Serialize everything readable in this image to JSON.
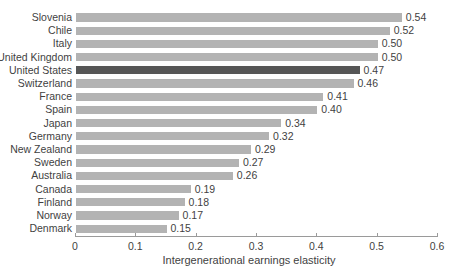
{
  "chart_data": {
    "type": "bar",
    "orientation": "horizontal",
    "title": "",
    "xlabel": "Intergenerational earnings elasticity",
    "ylabel": "",
    "xlim": [
      0,
      0.6
    ],
    "xticks": [
      "0",
      "0.1",
      "0.2",
      "0.3",
      "0.4",
      "0.5",
      "0.6"
    ],
    "xtick_values": [
      0,
      0.1,
      0.2,
      0.3,
      0.4,
      0.5,
      0.6
    ],
    "grid": false,
    "legend": false,
    "highlight_category": "United States",
    "colors": {
      "bar": "#b3b3b3",
      "bar_highlight": "#565656",
      "axis": "#9a9a9a",
      "text": "#3f3f3f",
      "background": "#ffffff"
    },
    "categories": [
      "Slovenia",
      "Chile",
      "Italy",
      "United Kingdom",
      "United States",
      "Switzerland",
      "France",
      "Spain",
      "Japan",
      "Germany",
      "New Zealand",
      "Sweden",
      "Australia",
      "Canada",
      "Finland",
      "Norway",
      "Denmark"
    ],
    "values": [
      0.54,
      0.52,
      0.5,
      0.5,
      0.47,
      0.46,
      0.41,
      0.4,
      0.34,
      0.32,
      0.29,
      0.27,
      0.26,
      0.19,
      0.18,
      0.17,
      0.15
    ],
    "value_labels": [
      "0.54",
      "0.52",
      "0.50",
      "0.50",
      "0.47",
      "0.46",
      "0.41",
      "0.40",
      "0.34",
      "0.32",
      "0.29",
      "0.27",
      "0.26",
      "0.19",
      "0.18",
      "0.17",
      "0.15"
    ]
  }
}
